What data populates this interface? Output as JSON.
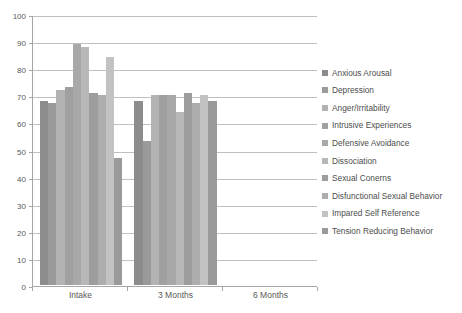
{
  "chart_data": {
    "type": "bar",
    "title": "",
    "xlabel": "",
    "ylabel": "",
    "ylim": [
      0,
      100
    ],
    "ytick_step": 10,
    "ytick_labels": [
      "100",
      "90",
      "80",
      "70",
      "60",
      "50",
      "40",
      "30",
      "20",
      "10",
      "0"
    ],
    "grid": true,
    "legend_position": "right",
    "categories": [
      "Intake",
      "3 Months",
      "6 Months"
    ],
    "series": [
      {
        "name": "Anxious Arousal",
        "color": "#8c8c8c",
        "values": [
          68,
          68,
          null
        ]
      },
      {
        "name": "Depression",
        "color": "#9a9a9a",
        "values": [
          67,
          53,
          null
        ]
      },
      {
        "name": "Anger/Irritability",
        "color": "#b3b3b3",
        "values": [
          72,
          70,
          null
        ]
      },
      {
        "name": "Intrusive Experiences",
        "color": "#a0a0a0",
        "values": [
          73,
          70,
          null
        ]
      },
      {
        "name": "Defensive Avoidance",
        "color": "#a8a8a8",
        "values": [
          89,
          70,
          null
        ]
      },
      {
        "name": "Dissociation",
        "color": "#b8b8b8",
        "values": [
          88,
          64,
          null
        ]
      },
      {
        "name": "Sexual Conerns",
        "color": "#9d9d9d",
        "values": [
          71,
          71,
          null
        ]
      },
      {
        "name": "Disfunctional Sexual Behavior",
        "color": "#adadad",
        "values": [
          70,
          67,
          null
        ]
      },
      {
        "name": "Impared Self Reference",
        "color": "#c2c2c2",
        "values": [
          84,
          70,
          null
        ]
      },
      {
        "name": "Tension Reducing Behavior",
        "color": "#9a9a9a",
        "values": [
          47,
          68,
          null
        ]
      }
    ]
  },
  "axis": {
    "y_labels": [
      "100",
      "90",
      "80",
      "70",
      "60",
      "50",
      "40",
      "30",
      "20",
      "10",
      "0"
    ],
    "x_labels": [
      "Intake",
      "3 Months",
      "6 Months"
    ]
  },
  "legend": {
    "items": [
      {
        "label": "Anxious Arousal"
      },
      {
        "label": "Depression"
      },
      {
        "label": "Anger/Irritability"
      },
      {
        "label": "Intrusive Experiences"
      },
      {
        "label": "Defensive Avoidance"
      },
      {
        "label": "Dissociation"
      },
      {
        "label": "Sexual Conerns"
      },
      {
        "label": "Disfunctional Sexual Behavior"
      },
      {
        "label": "Impared Self Reference"
      },
      {
        "label": "Tension Reducing Behavior"
      }
    ]
  }
}
